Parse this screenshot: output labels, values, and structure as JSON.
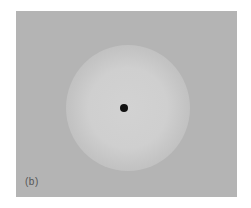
{
  "figure": {
    "panel_label": "(b)",
    "colors": {
      "background": "#b4b4b4",
      "glow": "#d2d2d2",
      "dot": "#111111"
    }
  }
}
